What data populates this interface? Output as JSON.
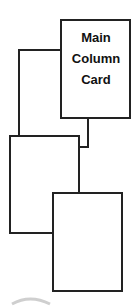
{
  "diagram": {
    "title": "",
    "stroke_color": "#222222",
    "background": "#ffffff",
    "nodes": [
      {
        "id": "main",
        "label": "Main\nColumn\nCard",
        "x": 61,
        "y": 20,
        "w": 69,
        "h": 98
      },
      {
        "id": "card2",
        "label": "",
        "x": 10,
        "y": 136,
        "w": 69,
        "h": 97
      },
      {
        "id": "card3",
        "label": "",
        "x": 53,
        "y": 193,
        "w": 69,
        "h": 98
      }
    ],
    "connectors": [
      {
        "from": "main",
        "to": "card2",
        "path": "left-elbow"
      },
      {
        "from": "main",
        "to": "card2",
        "path": "bottom-elbow"
      },
      {
        "from": "card2",
        "to": "card3",
        "path": "vertical"
      }
    ]
  }
}
